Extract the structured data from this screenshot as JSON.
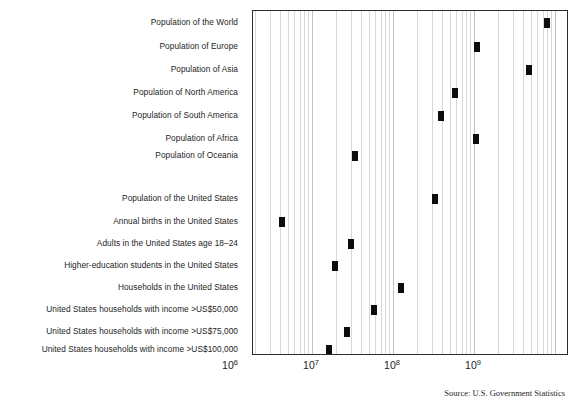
{
  "chart_data": {
    "type": "scatter",
    "title": "",
    "xlabel": "",
    "ylabel": "",
    "xscale": "log",
    "xlim": [
      1000000,
      10000000000
    ],
    "grid": true,
    "legend": "none",
    "tick_labels": [
      "10",
      "10",
      "10",
      "10"
    ],
    "tick_exponents": [
      "6",
      "7",
      "8",
      "9"
    ],
    "tick_values": [
      1000000,
      10000000,
      100000000,
      1000000000
    ],
    "categories": [
      "Population of the World",
      "Population of Europe",
      "Population of Asia",
      "Population of North America",
      "Population of South America",
      "Population of Africa",
      "Population of Oceania",
      "Population of the United States",
      "Annual births in the United States",
      "Adults in the United States age 18–24",
      "Higher-education students in the United States",
      "Households in the United States",
      "United States households with income >US$50,000",
      "United States households with income >US$75,000",
      "United States households with income >US$100,000"
    ],
    "values": [
      8000000000,
      1100000000,
      4800000000,
      580000000,
      390000000,
      1050000000,
      34000000,
      330000000,
      4200000,
      30000000,
      19000000,
      125000000,
      58000000,
      27000000,
      16000000
    ],
    "annotation": "Source: U.S. Government Statistics"
  },
  "source_note": "Source: U.S. Government Statistics"
}
